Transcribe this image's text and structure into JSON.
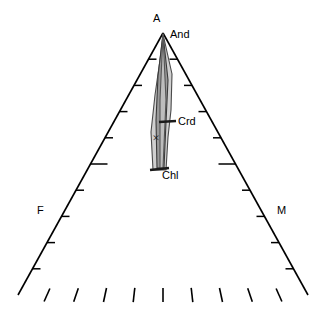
{
  "diagram": {
    "type": "ternary-phase-diagram",
    "background": "#ffffff",
    "line_color": "#000000",
    "width": 326,
    "height": 311,
    "apex": {
      "label": "A",
      "x": 163,
      "y": 33
    },
    "vertices": {
      "left": {
        "label": "F",
        "x": 18,
        "y": 295
      },
      "right": {
        "label": "M",
        "x": 308,
        "y": 295
      }
    },
    "labels": [
      {
        "name": "apex-label-a",
        "text": "A",
        "x": 153,
        "y": 13
      },
      {
        "name": "apex-label-and",
        "text": "And",
        "x": 170,
        "y": 29
      },
      {
        "name": "label-crd",
        "text": "Crd",
        "x": 178,
        "y": 116
      },
      {
        "name": "label-chl",
        "text": "Chl",
        "x": 162,
        "y": 170
      },
      {
        "name": "vertex-label-f",
        "text": "F",
        "x": 37,
        "y": 205
      },
      {
        "name": "vertex-label-m",
        "text": "M",
        "x": 277,
        "y": 205
      }
    ],
    "marker": {
      "name": "data-point-x",
      "glyph": "×",
      "x": 156,
      "y": 142
    },
    "ticks": {
      "count_per_edge": 10,
      "major_index": 5,
      "minor_length": 8,
      "major_length": 17,
      "bottom_tick_length": 13,
      "bottom_tick_count": 9
    },
    "fields": [
      {
        "name": "field-light-wedge",
        "label": "Chl",
        "fill": "#d0d0d0",
        "stroke": "#4a4a4a",
        "points": "163,34 172,74 171,110 168,137 166,170 153,170 151,132 155,95 160,60"
      },
      {
        "name": "field-dark-wedge",
        "label": "Crd",
        "fill": "#9a9a9a",
        "stroke": "#3a3a3a",
        "points": "163,34 168,80 166,122 164,168 157,168 156,120 158,76"
      },
      {
        "name": "field-sliver",
        "label": "",
        "fill": "#bdbdbd",
        "stroke": "#555555",
        "points": "163,34 166,100 163,168 160,168 160,100"
      }
    ],
    "bar_crd": {
      "name": "tie-line-crd",
      "x1": 159,
      "y1": 122,
      "x2": 176,
      "y2": 121
    },
    "bar_chl": {
      "name": "tie-line-chl",
      "x1": 150,
      "y1": 170,
      "x2": 169,
      "y2": 168
    }
  }
}
